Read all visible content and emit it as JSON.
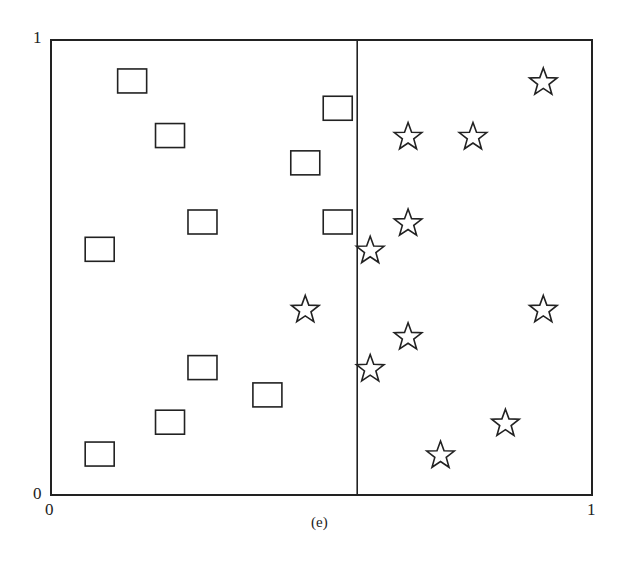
{
  "chart_data": {
    "type": "scatter",
    "title": "",
    "caption": "(e)",
    "xlabel": "",
    "ylabel": "",
    "xlim": [
      0,
      1
    ],
    "ylim": [
      0,
      1
    ],
    "grid": false,
    "legend": null,
    "x_ticks": [
      "0",
      "1"
    ],
    "y_ticks": [
      "0",
      "1"
    ],
    "divider": {
      "type": "vertical_line",
      "x": 0.566
    },
    "series": [
      {
        "name": "squares",
        "marker": "square",
        "points": [
          [
            0.15,
            0.91
          ],
          [
            0.22,
            0.79
          ],
          [
            0.53,
            0.85
          ],
          [
            0.47,
            0.73
          ],
          [
            0.28,
            0.6
          ],
          [
            0.53,
            0.6
          ],
          [
            0.09,
            0.54
          ],
          [
            0.28,
            0.28
          ],
          [
            0.4,
            0.22
          ],
          [
            0.22,
            0.16
          ],
          [
            0.09,
            0.09
          ]
        ]
      },
      {
        "name": "stars",
        "marker": "star",
        "points": [
          [
            0.91,
            0.91
          ],
          [
            0.66,
            0.79
          ],
          [
            0.78,
            0.79
          ],
          [
            0.66,
            0.6
          ],
          [
            0.59,
            0.54
          ],
          [
            0.47,
            0.41
          ],
          [
            0.91,
            0.41
          ],
          [
            0.66,
            0.35
          ],
          [
            0.59,
            0.28
          ],
          [
            0.84,
            0.16
          ],
          [
            0.72,
            0.09
          ]
        ]
      }
    ]
  },
  "labels": {
    "y_top": "1",
    "y_bottom": "0",
    "x_left": "0",
    "x_right": "1",
    "caption": "(e)"
  },
  "style": {
    "stroke": "#222222",
    "background": "#ffffff"
  }
}
